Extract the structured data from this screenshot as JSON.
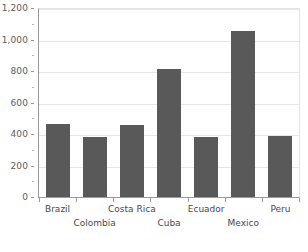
{
  "chart_data": {
    "type": "bar",
    "title": "",
    "subtitle": "",
    "xlabel": "",
    "ylabel": "",
    "categories": [
      "Brazil",
      "Colombia",
      "Costa Rica",
      "Cuba",
      "Ecuador",
      "Mexico",
      "Peru"
    ],
    "values": [
      465,
      380,
      460,
      815,
      380,
      1055,
      390
    ],
    "ylim": [
      0,
      1200
    ],
    "ytick_values": [
      0,
      200,
      400,
      600,
      800,
      1000,
      1200
    ],
    "ytick_labels": [
      "0",
      "200",
      "400",
      "600",
      "800",
      "1,000",
      "1,200"
    ],
    "grid": true,
    "legend": "none",
    "series": [
      {
        "name": "Series 1",
        "color": "#595959",
        "values": [
          465,
          380,
          460,
          815,
          380,
          1055,
          390
        ]
      }
    ],
    "axis_color": "#9a9a9a",
    "gridline_color": "#e6e6e6",
    "background_color": "#ffffff"
  }
}
